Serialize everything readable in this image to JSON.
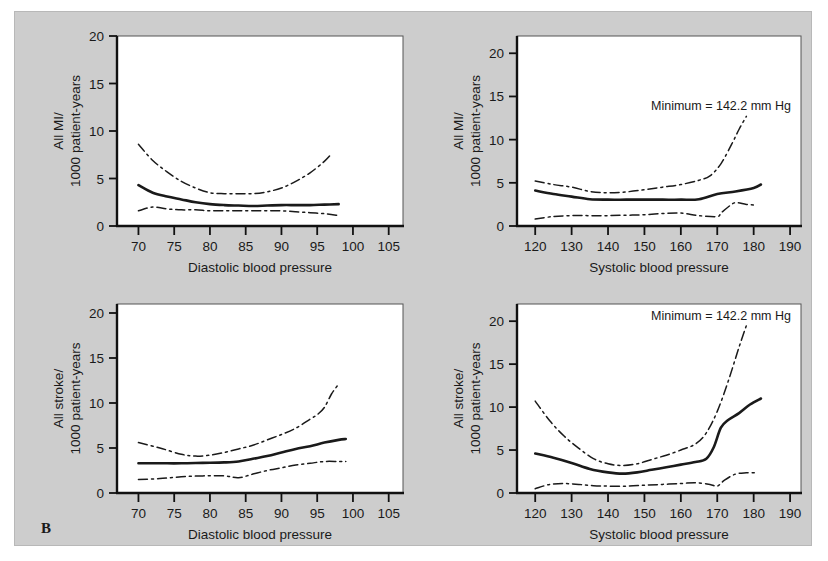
{
  "figure": {
    "panel_letter": "B",
    "background_color": "#cdcdcd",
    "line_color": "#1a1a1a"
  },
  "chart_data": [
    {
      "id": "mi-diastolic",
      "type": "line",
      "position": "top-left",
      "title": "",
      "xlabel": "Diastolic blood pressure",
      "ylabel": "All MI/\n1000 patient-years",
      "ylabel_line1": "All MI/",
      "ylabel_line2": "1000 patient-years",
      "xlim": [
        67,
        107
      ],
      "ylim": [
        0,
        20
      ],
      "xticks": [
        70,
        75,
        80,
        85,
        90,
        95,
        100,
        105
      ],
      "yticks": [
        0,
        5,
        10,
        15,
        20
      ],
      "xticklabels": [
        "70",
        "75",
        "80",
        "85",
        "90",
        "95",
        "100",
        "105"
      ],
      "yticklabels": [
        "0",
        "5",
        "10",
        "15",
        "20"
      ],
      "grid": false,
      "legend": "none",
      "annotation": "",
      "series": [
        {
          "name": "estimate",
          "style": "solid",
          "x": [
            70,
            72,
            74,
            76,
            78,
            80,
            82,
            84,
            86,
            88,
            90,
            92,
            94,
            96,
            98
          ],
          "values": [
            4.3,
            3.5,
            3.1,
            2.8,
            2.5,
            2.3,
            2.2,
            2.15,
            2.1,
            2.15,
            2.2,
            2.2,
            2.2,
            2.25,
            2.3
          ]
        },
        {
          "name": "upper-confidence-limit",
          "style": "dash-dot",
          "x": [
            70,
            72,
            74,
            76,
            78,
            80,
            82,
            84,
            86,
            88,
            90,
            92,
            94,
            96,
            97
          ],
          "values": [
            8.6,
            6.9,
            5.7,
            4.7,
            4.0,
            3.5,
            3.4,
            3.4,
            3.4,
            3.6,
            4.0,
            4.7,
            5.6,
            6.8,
            7.6
          ]
        },
        {
          "name": "lower-confidence-limit",
          "style": "dash-dot",
          "x": [
            70,
            72,
            74,
            76,
            78,
            80,
            82,
            84,
            86,
            88,
            90,
            92,
            94,
            96,
            98
          ],
          "values": [
            1.6,
            2.0,
            1.8,
            1.7,
            1.7,
            1.6,
            1.6,
            1.6,
            1.6,
            1.6,
            1.6,
            1.5,
            1.4,
            1.3,
            1.1
          ]
        }
      ]
    },
    {
      "id": "mi-systolic",
      "type": "line",
      "position": "top-right",
      "title": "",
      "xlabel": "Systolic blood pressure",
      "ylabel": "All MI/\n1000 patient-years",
      "ylabel_line1": "All MI/",
      "ylabel_line2": "1000 patient-years",
      "xlim": [
        115,
        193
      ],
      "ylim": [
        0,
        22
      ],
      "xticks": [
        120,
        130,
        140,
        150,
        160,
        170,
        180,
        190
      ],
      "yticks": [
        0,
        5,
        10,
        15,
        20
      ],
      "xticklabels": [
        "120",
        "130",
        "140",
        "150",
        "160",
        "170",
        "180",
        "190"
      ],
      "yticklabels": [
        "0",
        "5",
        "10",
        "15",
        "20"
      ],
      "grid": false,
      "legend": "none",
      "annotation": "Minimum = 142.2 mm Hg",
      "series": [
        {
          "name": "estimate",
          "style": "solid",
          "x": [
            120,
            125,
            130,
            135,
            140,
            145,
            150,
            155,
            160,
            165,
            170,
            175,
            180,
            182
          ],
          "values": [
            4.1,
            3.7,
            3.4,
            3.1,
            3.05,
            3.05,
            3.05,
            3.05,
            3.05,
            3.1,
            3.7,
            4.0,
            4.4,
            4.8
          ]
        },
        {
          "name": "upper-confidence-limit",
          "style": "dash-dot",
          "x": [
            120,
            125,
            130,
            135,
            140,
            145,
            150,
            155,
            160,
            165,
            168,
            171,
            174,
            176,
            178
          ],
          "values": [
            5.2,
            4.8,
            4.5,
            4.0,
            3.85,
            3.95,
            4.2,
            4.5,
            4.8,
            5.3,
            5.8,
            7.2,
            9.5,
            11.2,
            12.7
          ]
        },
        {
          "name": "lower-confidence-limit",
          "style": "dash-dot",
          "x": [
            120,
            125,
            130,
            135,
            140,
            145,
            150,
            155,
            160,
            165,
            170,
            171,
            173,
            175,
            178,
            181
          ],
          "values": [
            0.8,
            1.1,
            1.2,
            1.2,
            1.2,
            1.25,
            1.3,
            1.45,
            1.5,
            1.2,
            1.1,
            1.5,
            2.2,
            2.7,
            2.5,
            2.4
          ]
        }
      ]
    },
    {
      "id": "stroke-diastolic",
      "type": "line",
      "position": "bottom-left",
      "title": "",
      "xlabel": "Diastolic blood pressure",
      "ylabel": "All stroke/\n1000 patient-years",
      "ylabel_line1": "All stroke/",
      "ylabel_line2": "1000 patient-years",
      "xlim": [
        67,
        107
      ],
      "ylim": [
        0,
        21
      ],
      "xticks": [
        70,
        75,
        80,
        85,
        90,
        95,
        100,
        105
      ],
      "yticks": [
        0,
        5,
        10,
        15,
        20
      ],
      "xticklabels": [
        "70",
        "75",
        "80",
        "85",
        "90",
        "95",
        "100",
        "105"
      ],
      "yticklabels": [
        "0",
        "5",
        "10",
        "15",
        "20"
      ],
      "grid": false,
      "legend": "none",
      "annotation": "",
      "series": [
        {
          "name": "estimate",
          "style": "solid",
          "x": [
            70,
            73,
            76,
            79,
            82,
            84,
            86,
            88,
            90,
            92,
            94,
            96,
            98,
            99
          ],
          "values": [
            3.3,
            3.3,
            3.3,
            3.35,
            3.4,
            3.5,
            3.8,
            4.1,
            4.5,
            4.9,
            5.2,
            5.6,
            5.9,
            6.0
          ]
        },
        {
          "name": "upper-confidence-limit",
          "style": "dash-dot",
          "x": [
            70,
            73,
            76,
            78,
            80,
            82,
            84,
            86,
            88,
            90,
            92,
            94,
            95,
            96,
            97,
            98
          ],
          "values": [
            5.6,
            5.0,
            4.3,
            4.1,
            4.2,
            4.5,
            4.9,
            5.3,
            5.9,
            6.5,
            7.2,
            8.2,
            8.7,
            9.5,
            11.0,
            12.1
          ]
        },
        {
          "name": "lower-confidence-limit",
          "style": "dash-dot",
          "x": [
            70,
            73,
            76,
            79,
            82,
            84,
            86,
            88,
            90,
            92,
            94,
            96,
            98,
            99
          ],
          "values": [
            1.5,
            1.6,
            1.8,
            1.9,
            1.9,
            1.7,
            2.1,
            2.5,
            2.8,
            3.1,
            3.3,
            3.5,
            3.5,
            3.5
          ]
        }
      ]
    },
    {
      "id": "stroke-systolic",
      "type": "line",
      "position": "bottom-right",
      "title": "",
      "xlabel": "Systolic blood pressure",
      "ylabel": "All stroke/\n1000 patient-years",
      "ylabel_line1": "All stroke/",
      "ylabel_line2": "1000 patient-years",
      "xlim": [
        115,
        193
      ],
      "ylim": [
        0,
        22
      ],
      "xticks": [
        120,
        130,
        140,
        150,
        160,
        170,
        180,
        190
      ],
      "yticks": [
        0,
        5,
        10,
        15,
        20
      ],
      "xticklabels": [
        "120",
        "130",
        "140",
        "150",
        "160",
        "170",
        "180",
        "190"
      ],
      "yticklabels": [
        "0",
        "5",
        "10",
        "15",
        "20"
      ],
      "grid": false,
      "legend": "none",
      "annotation": "Minimum = 142.2 mm Hg",
      "series": [
        {
          "name": "estimate",
          "style": "solid",
          "x": [
            120,
            125,
            130,
            135,
            140,
            144,
            148,
            152,
            156,
            160,
            164,
            167,
            169,
            171,
            173,
            176,
            179,
            182
          ],
          "values": [
            4.6,
            4.1,
            3.5,
            2.8,
            2.4,
            2.25,
            2.4,
            2.7,
            3.0,
            3.3,
            3.6,
            4.0,
            5.3,
            7.6,
            8.5,
            9.3,
            10.3,
            11.0
          ]
        },
        {
          "name": "upper-confidence-limit",
          "style": "dash-dot",
          "x": [
            120,
            124,
            128,
            132,
            136,
            140,
            144,
            148,
            152,
            156,
            160,
            164,
            167,
            170,
            173,
            176,
            178
          ],
          "values": [
            10.7,
            8.4,
            6.6,
            5.2,
            4.0,
            3.4,
            3.2,
            3.4,
            3.9,
            4.4,
            5.0,
            5.7,
            7.0,
            9.5,
            13.0,
            17.0,
            19.5
          ]
        },
        {
          "name": "lower-confidence-limit",
          "style": "dash-dot",
          "x": [
            120,
            124,
            128,
            132,
            136,
            140,
            145,
            150,
            155,
            160,
            164,
            168,
            170,
            172,
            175,
            178,
            181
          ],
          "values": [
            0.5,
            1.0,
            1.1,
            1.0,
            0.85,
            0.8,
            0.8,
            0.9,
            1.0,
            1.1,
            1.2,
            1.0,
            0.8,
            1.5,
            2.2,
            2.35,
            2.35
          ]
        }
      ]
    }
  ]
}
